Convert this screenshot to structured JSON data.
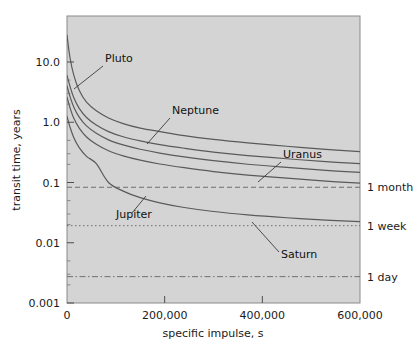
{
  "chart_data": {
    "type": "line",
    "title": "",
    "xlabel": "specific impulse, s",
    "ylabel": "transit time, years",
    "xlim": [
      0,
      620000
    ],
    "ylim": [
      0.001,
      30.0
    ],
    "yscale": "log",
    "xscale": "linear",
    "grid": false,
    "legend": "inline-annotations",
    "plot_background": "#d4d4d4",
    "line_color": "#5a5a5a",
    "xticks": [
      {
        "value": 0,
        "label": "0"
      },
      {
        "value": 200000,
        "label": "200,000"
      },
      {
        "value": 400000,
        "label": "400,000"
      },
      {
        "value": 600000,
        "label": "600,000"
      }
    ],
    "yticks": [
      {
        "value": 10.0,
        "label": "10.0"
      },
      {
        "value": 1.0,
        "label": "1.0"
      },
      {
        "value": 0.1,
        "label": "0.1"
      },
      {
        "value": 0.01,
        "label": "0.01"
      },
      {
        "value": 0.001,
        "label": "0.001"
      }
    ],
    "series": [
      {
        "name": "Pluto",
        "label": "Pluto",
        "label_x": 105,
        "label_y": 62,
        "leader": [
          [
            103,
            66
          ],
          [
            74,
            89
          ]
        ],
        "points": [
          [
            0,
            28.0
          ],
          [
            6000,
            12.0
          ],
          [
            14000,
            6.0
          ],
          [
            25000,
            3.4
          ],
          [
            40000,
            2.15
          ],
          [
            60000,
            1.55
          ],
          [
            85000,
            1.18
          ],
          [
            115000,
            0.95
          ],
          [
            150000,
            0.8
          ],
          [
            190000,
            0.7
          ],
          [
            240000,
            0.6
          ],
          [
            300000,
            0.52
          ],
          [
            370000,
            0.455
          ],
          [
            450000,
            0.4
          ],
          [
            530000,
            0.355
          ],
          [
            600000,
            0.325
          ]
        ]
      },
      {
        "name": "Neptune",
        "label": "Neptune",
        "label_x": 172,
        "label_y": 114,
        "leader": [
          [
            170,
            118
          ],
          [
            147,
            144
          ]
        ],
        "points": [
          [
            0,
            6.0
          ],
          [
            6000,
            4.0
          ],
          [
            14000,
            2.55
          ],
          [
            25000,
            1.7
          ],
          [
            40000,
            1.2
          ],
          [
            60000,
            0.9
          ],
          [
            85000,
            0.7
          ],
          [
            115000,
            0.575
          ],
          [
            150000,
            0.49
          ],
          [
            190000,
            0.425
          ],
          [
            240000,
            0.37
          ],
          [
            300000,
            0.32
          ],
          [
            370000,
            0.28
          ],
          [
            450000,
            0.248
          ],
          [
            530000,
            0.222
          ],
          [
            600000,
            0.205
          ]
        ]
      },
      {
        "name": "Uranus",
        "label": "Uranus",
        "label_x": 283,
        "label_y": 158,
        "leader": [
          [
            281,
            162
          ],
          [
            258,
            182
          ]
        ],
        "points": [
          [
            0,
            4.0
          ],
          [
            6000,
            2.7
          ],
          [
            14000,
            1.78
          ],
          [
            25000,
            1.22
          ],
          [
            40000,
            0.87
          ],
          [
            60000,
            0.655
          ],
          [
            85000,
            0.51
          ],
          [
            115000,
            0.42
          ],
          [
            150000,
            0.356
          ],
          [
            190000,
            0.308
          ],
          [
            240000,
            0.266
          ],
          [
            300000,
            0.23
          ],
          [
            370000,
            0.201
          ],
          [
            450000,
            0.178
          ],
          [
            530000,
            0.159
          ],
          [
            600000,
            0.147
          ]
        ]
      },
      {
        "name": "Saturn",
        "label": "Saturn",
        "label_x": 281,
        "label_y": 258,
        "leader": [
          [
            279,
            252
          ],
          [
            252,
            222
          ]
        ],
        "points": [
          [
            0,
            2.6
          ],
          [
            6000,
            1.76
          ],
          [
            14000,
            1.16
          ],
          [
            25000,
            0.8
          ],
          [
            40000,
            0.57
          ],
          [
            60000,
            0.43
          ],
          [
            85000,
            0.336
          ],
          [
            115000,
            0.277
          ],
          [
            150000,
            0.235
          ],
          [
            190000,
            0.203
          ],
          [
            240000,
            0.176
          ],
          [
            300000,
            0.152
          ],
          [
            370000,
            0.133
          ],
          [
            450000,
            0.118
          ],
          [
            530000,
            0.1055
          ],
          [
            600000,
            0.0975
          ]
        ]
      },
      {
        "name": "Jupiter",
        "label": "Jupiter",
        "label_x": 116,
        "label_y": 218,
        "leader": [
          [
            132,
            213
          ],
          [
            146,
            196
          ]
        ],
        "points": [
          [
            0,
            1.25
          ],
          [
            6000,
            0.84
          ],
          [
            14000,
            0.555
          ],
          [
            25000,
            0.38
          ],
          [
            40000,
            0.272
          ],
          [
            60000,
            0.205
          ],
          [
            85000,
            0.1
          ],
          [
            115000,
            0.072
          ],
          [
            150000,
            0.056
          ],
          [
            190000,
            0.046
          ],
          [
            240000,
            0.0385
          ],
          [
            300000,
            0.033
          ],
          [
            370000,
            0.029
          ],
          [
            450000,
            0.026
          ],
          [
            530000,
            0.0238
          ],
          [
            600000,
            0.0225
          ]
        ]
      }
    ],
    "reference_lines": [
      {
        "name": "1 month",
        "label": "1 month",
        "value": 0.0833,
        "style": "dashed"
      },
      {
        "name": "1 week",
        "label": "1 week",
        "value": 0.0192,
        "style": "dotted"
      },
      {
        "name": "1 day",
        "label": "1 day",
        "value": 0.00274,
        "style": "dashdot"
      }
    ]
  }
}
